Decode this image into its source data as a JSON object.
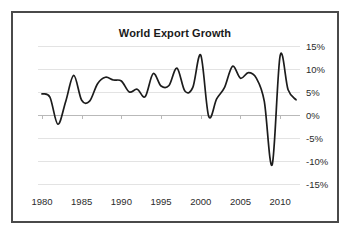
{
  "chart_data": {
    "type": "line",
    "title": "World Export Growth",
    "xlabel": "",
    "ylabel": "",
    "xlim": [
      1979.5,
      2012.5
    ],
    "ylim": [
      -15,
      15
    ],
    "grid": true,
    "legend": "none",
    "xticks": [
      "1980",
      "1985",
      "1990",
      "1995",
      "2000",
      "2005",
      "2010"
    ],
    "xtick_values": [
      1980,
      1985,
      1990,
      1995,
      2000,
      2005,
      2010
    ],
    "yticks": [
      "15%",
      "10%",
      "5%",
      "0%",
      "-5%",
      "-10%",
      "-15%"
    ],
    "ytick_values": [
      15,
      10,
      5,
      0,
      -5,
      -10,
      -15
    ],
    "series": [
      {
        "name": "World Export Growth",
        "color": "#1c1c1c",
        "x": [
          1980,
          1981,
          1982,
          1983,
          1984,
          1985,
          1986,
          1987,
          1988,
          1989,
          1990,
          1991,
          1992,
          1993,
          1994,
          1995,
          1996,
          1997,
          1998,
          1999,
          2000,
          2001,
          2002,
          2003,
          2004,
          2005,
          2006,
          2007,
          2008,
          2009,
          2010,
          2011,
          2012
        ],
        "values": [
          4.6,
          3.9,
          -2.0,
          3.0,
          8.6,
          3.2,
          3.0,
          6.8,
          8.2,
          7.6,
          7.4,
          5.0,
          5.6,
          4.0,
          9.0,
          6.3,
          6.4,
          10.2,
          5.2,
          6.0,
          13.0,
          -0.3,
          3.5,
          6.0,
          10.6,
          8.0,
          9.2,
          8.0,
          3.0,
          -10.8,
          12.9,
          5.5,
          3.3
        ]
      }
    ]
  },
  "figure": {
    "title": "World Export Growth",
    "border_color": "#4a4a4a",
    "background": "#ffffff",
    "grid_color": "#e3e3e3",
    "axis_color": "#b9b9b9",
    "line_color": "#1c1c1c"
  }
}
